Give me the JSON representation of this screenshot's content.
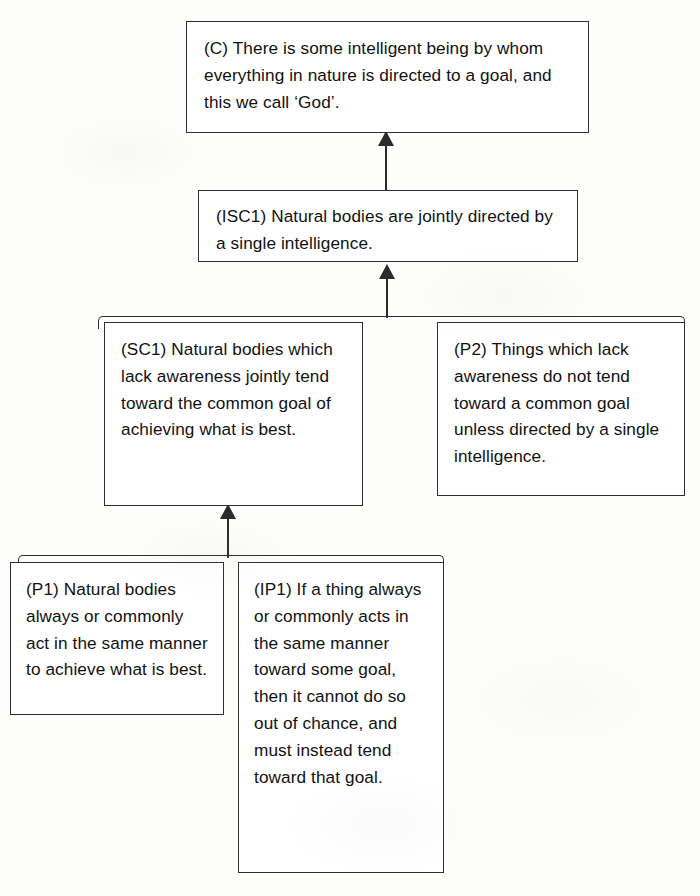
{
  "diagram": {
    "type": "argument-map",
    "background_color": "#ffffff",
    "line_color": "#2e2e2e",
    "text_color": "#111111"
  },
  "nodes": [
    {
      "id": "C",
      "role": "conclusion",
      "label": "(C)",
      "text": "(C) There is some intelligent being by whom everything in nature is directed to a goal, and this we call ‘God’."
    },
    {
      "id": "ISC1",
      "role": "intermediate-sub-conclusion",
      "label": "(ISC1)",
      "text": "(ISC1) Natural bodies are jointly directed by a single intelligence."
    },
    {
      "id": "SC1",
      "role": "sub-conclusion",
      "label": "(SC1)",
      "text": "(SC1) Natural bodies which lack awareness jointly tend toward the common goal of achieving what is best."
    },
    {
      "id": "P2",
      "role": "premise",
      "label": "(P2)",
      "text": "(P2) Things which lack awareness do not tend toward a common goal unless directed by a single intelligence."
    },
    {
      "id": "P1",
      "role": "premise",
      "label": "(P1)",
      "text": "(P1) Natural bodies always or commonly act in the same manner to achieve what is best."
    },
    {
      "id": "IP1",
      "role": "implicit-premise",
      "label": "(IP1)",
      "text": "(IP1) If a thing always or commonly acts in the same manner toward some goal, then it cannot do so out of chance, and must instead tend toward that goal."
    }
  ],
  "connections": [
    {
      "id": "arrow-isc1-to-c",
      "from": "ISC1",
      "to": "C",
      "style": "single-arrow-up"
    },
    {
      "id": "arrow-sc1p2-to-isc1",
      "from": [
        "SC1",
        "P2"
      ],
      "to": "ISC1",
      "style": "joint-bracket-arrow-up"
    },
    {
      "id": "arrow-p1ip1-to-sc1",
      "from": [
        "P1",
        "IP1"
      ],
      "to": "SC1",
      "style": "joint-bracket-arrow-up"
    }
  ]
}
